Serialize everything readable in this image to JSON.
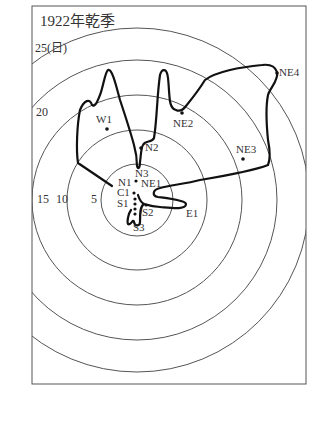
{
  "figure": {
    "title": "1922年乾季",
    "ring_labels": [
      {
        "text": "25(日)",
        "x": 35,
        "y": 43
      },
      {
        "text": "20",
        "x": 36,
        "y": 88
      },
      {
        "text": "15",
        "x": 37,
        "y": 193
      },
      {
        "text": "10",
        "x": 56,
        "y": 193
      },
      {
        "text": "5",
        "x": 91,
        "y": 193
      }
    ],
    "stations": [
      {
        "id": "W1",
        "text": "W1",
        "x": 107,
        "y": 129,
        "lx": 97,
        "ly": 114
      },
      {
        "id": "N2",
        "text": "N2",
        "x": 141,
        "y": 148,
        "lx": 146,
        "ly": 141
      },
      {
        "id": "NE2",
        "text": "NE2",
        "x": 182,
        "y": 113,
        "lx": 174,
        "ly": 118
      },
      {
        "id": "NE4",
        "text": "NE4",
        "x": 277,
        "y": 73,
        "lx": 280,
        "ly": 67
      },
      {
        "id": "NE3",
        "text": "NE3",
        "x": 243,
        "y": 159,
        "lx": 237,
        "ly": 144
      },
      {
        "id": "N3",
        "text": "N3",
        "x": 137,
        "y": 169,
        "lx": 136,
        "ly": 168
      },
      {
        "id": "N1",
        "text": "N1",
        "x": 135,
        "y": 181,
        "lx": 118,
        "ly": 176
      },
      {
        "id": "NE1",
        "text": "NE1",
        "x": 138,
        "y": 181,
        "lx": 142,
        "ly": 178
      },
      {
        "id": "C1",
        "text": "C1",
        "x": 134,
        "y": 193,
        "lx": 117,
        "ly": 187
      },
      {
        "id": "S1",
        "text": "S1",
        "x": 134,
        "y": 203,
        "lx": 117,
        "ly": 198
      },
      {
        "id": "S2",
        "text": "S2",
        "x": 143,
        "y": 210,
        "lx": 141,
        "ly": 207
      },
      {
        "id": "S3",
        "text": "S3",
        "x": 135,
        "y": 225,
        "lx": 134,
        "ly": 222
      },
      {
        "id": "E1",
        "text": "E1",
        "x": 185,
        "y": 206,
        "lx": 186,
        "ly": 208
      }
    ],
    "rings": {
      "center_x": 137,
      "center_y": 200,
      "radii": [
        36,
        70,
        105,
        140,
        172
      ]
    },
    "colors": {
      "frame": "#555555",
      "rings": "#555555",
      "isochrone": "#111111",
      "text": "#333333"
    }
  }
}
